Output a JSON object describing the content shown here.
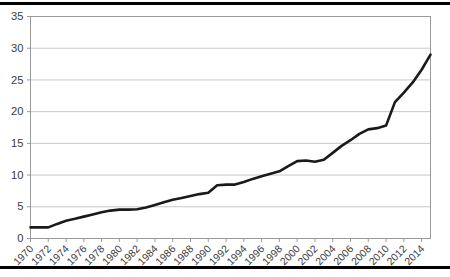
{
  "chart_data": {
    "type": "line",
    "title": "",
    "subtitle": "",
    "xlabel": "",
    "ylabel": "",
    "xlim": [
      1970,
      2015
    ],
    "ylim": [
      0,
      35
    ],
    "ytick_step": 5,
    "xtick_step": 2,
    "grid": true,
    "grid_axis": "y",
    "legend": false,
    "legend_position": "none",
    "line_color": "#1a1a1a",
    "grid_color": "#c8c8c8",
    "axis_color": "#9a9a9a",
    "tick_label_color": "#3c3c3c",
    "x_tick_label_rotation": -45,
    "yticks": [
      "0",
      "5",
      "10",
      "15",
      "20",
      "25",
      "30",
      "35"
    ],
    "xticks": [
      "1970",
      "1972",
      "1974",
      "1976",
      "1978",
      "1980",
      "1982",
      "1984",
      "1986",
      "1988",
      "1990",
      "1992",
      "1994",
      "1996",
      "1998",
      "2000",
      "2002",
      "2004",
      "2006",
      "2008",
      "2010",
      "2012",
      "2014"
    ],
    "x": [
      1970,
      1971,
      1972,
      1973,
      1974,
      1975,
      1976,
      1977,
      1978,
      1979,
      1980,
      1981,
      1982,
      1983,
      1984,
      1985,
      1986,
      1987,
      1988,
      1989,
      1990,
      1991,
      1992,
      1993,
      1994,
      1995,
      1996,
      1997,
      1998,
      1999,
      2000,
      2001,
      2002,
      2003,
      2004,
      2005,
      2006,
      2007,
      2008,
      2009,
      2010,
      2011,
      2012,
      2013,
      2014,
      2015
    ],
    "values": [
      1.75,
      1.75,
      1.75,
      2.3,
      2.8,
      3.1,
      3.45,
      3.8,
      4.15,
      4.4,
      4.55,
      4.55,
      4.6,
      4.9,
      5.3,
      5.7,
      6.1,
      6.4,
      6.7,
      7.0,
      7.2,
      8.4,
      8.5,
      8.5,
      8.9,
      9.4,
      9.8,
      10.2,
      10.6,
      11.4,
      12.2,
      12.3,
      12.1,
      12.4,
      13.5,
      14.6,
      15.5,
      16.5,
      17.2,
      17.4,
      17.8,
      21.5,
      23.0,
      24.6,
      26.6,
      29.0
    ],
    "series": [
      {
        "name": "series-1",
        "values": [
          1.75,
          1.75,
          1.75,
          2.3,
          2.8,
          3.1,
          3.45,
          3.8,
          4.15,
          4.4,
          4.55,
          4.55,
          4.6,
          4.9,
          5.3,
          5.7,
          6.1,
          6.4,
          6.7,
          7.0,
          7.2,
          8.4,
          8.5,
          8.5,
          8.9,
          9.4,
          9.8,
          10.2,
          10.6,
          11.4,
          12.2,
          12.3,
          12.1,
          12.4,
          13.5,
          14.6,
          15.5,
          16.5,
          17.2,
          17.4,
          17.8,
          21.5,
          23.0,
          24.6,
          26.6,
          29.0
        ]
      }
    ],
    "annotations": []
  },
  "figure": {
    "top_rule": "",
    "bottom_rule": ""
  }
}
